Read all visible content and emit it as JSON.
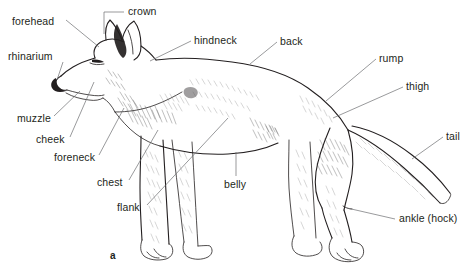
{
  "figure": {
    "caption_letter": "a",
    "background_color": "#ffffff",
    "ink_color": "#231f20",
    "leader_color": "#6d6e71"
  },
  "labels": [
    {
      "id": "forehead",
      "text": "forehead"
    },
    {
      "id": "crown",
      "text": "crown"
    },
    {
      "id": "hindneck",
      "text": "hindneck"
    },
    {
      "id": "back",
      "text": "back"
    },
    {
      "id": "rump",
      "text": "rump"
    },
    {
      "id": "thigh",
      "text": "thigh"
    },
    {
      "id": "tail",
      "text": "tail"
    },
    {
      "id": "rhinarium",
      "text": "rhinarium"
    },
    {
      "id": "muzzle",
      "text": "muzzle"
    },
    {
      "id": "cheek",
      "text": "cheek"
    },
    {
      "id": "foreneck",
      "text": "foreneck"
    },
    {
      "id": "chest",
      "text": "chest"
    },
    {
      "id": "flank",
      "text": "flank"
    },
    {
      "id": "belly",
      "text": "belly"
    },
    {
      "id": "ankle_hock",
      "text": "ankle (hock)"
    }
  ]
}
